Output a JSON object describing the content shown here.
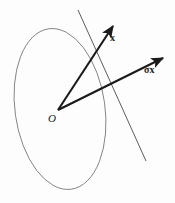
{
  "figure": {
    "name": "vector-reflection-ellipse-diagram",
    "width": 175,
    "height": 203,
    "background_color": "#fdfdfd",
    "stroke_color": "#1a1a1a",
    "ellipse_stroke_color": "#6e6e6e",
    "line_stroke_color": "#4a4a4a"
  },
  "labels": {
    "origin": "O",
    "vector_x": "x",
    "vector_sigma_x_sigma": "σ",
    "vector_sigma_x_operand": "x"
  },
  "geometry": {
    "origin_point": {
      "x": 58,
      "y": 110
    },
    "ellipse": {
      "center_x": 60,
      "center_y": 109,
      "radius_x": 45,
      "radius_y": 81,
      "rotation_deg": -8
    },
    "vector_x": {
      "from_x": 58,
      "from_y": 110,
      "to_x": 115,
      "to_y": 23,
      "label": "x"
    },
    "vector_sigma_x": {
      "from_x": 58,
      "from_y": 110,
      "to_x": 166,
      "to_y": 56,
      "label": "σx"
    },
    "mirror_line": {
      "from_x": 78,
      "from_y": 10,
      "to_x": 146,
      "to_y": 161
    }
  }
}
